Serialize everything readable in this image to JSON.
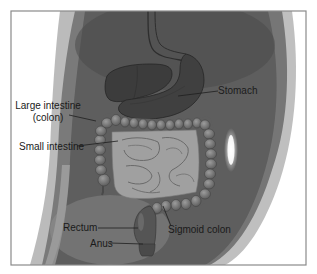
{
  "figure": {
    "labels": {
      "stomach": "Stomach",
      "large_intestine_line1": "Large intestine",
      "large_intestine_line2": "(colon)",
      "small_intestine": "Small intestine",
      "rectum": "Rectum",
      "anus": "Anus",
      "sigmoid_colon": "Sigmoid colon"
    },
    "colors": {
      "frame": "#8a8a8a",
      "background": "#ffffff",
      "body_silhouette": "#5c5c5c",
      "organ_dark": "#3a3a3a",
      "colon": "#6e6e6e",
      "small_intestine": "#9a9a9a",
      "leader_line": "#222222"
    }
  }
}
